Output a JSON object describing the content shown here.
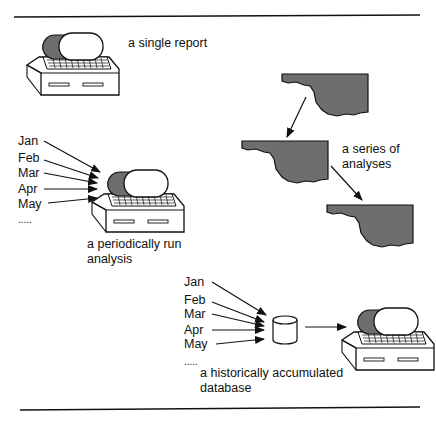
{
  "diagram": {
    "panels": [
      {
        "id": "single",
        "caption": "a single report"
      },
      {
        "id": "periodic",
        "caption_line1": "a periodically run",
        "caption_line2": "analysis",
        "inputs": [
          "Jan",
          "Feb",
          "Mar",
          "Apr",
          "May",
          "....."
        ]
      },
      {
        "id": "series",
        "caption_line1": "a series of",
        "caption_line2": "analyses"
      },
      {
        "id": "historic",
        "caption_line1": "a historically accumulated",
        "caption_line2": "database",
        "inputs": [
          "Jan",
          "Feb",
          "Mar",
          "Apr",
          "May",
          "....."
        ]
      }
    ],
    "icons": {
      "computer": "computer-icon",
      "map": "map-shape-icon",
      "database": "database-cylinder-icon",
      "arrow": "arrow-icon"
    },
    "colors": {
      "ink": "#111111",
      "shade": "#6e6e6e",
      "background": "#ffffff"
    }
  }
}
